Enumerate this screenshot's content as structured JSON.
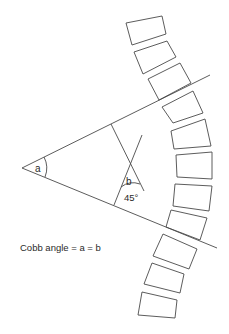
{
  "figure": {
    "colors": {
      "stroke": "#4a4a4a",
      "text": "#2a2a2a",
      "background": "#ffffff"
    },
    "labels": {
      "angle_a": "a",
      "angle_b": "b",
      "angle_b_value": "45°",
      "caption": "Cobb angle = a = b"
    },
    "vertebrae": [
      "126,23 162,16 166,34 132,45",
      "134,52 167,41 176,57 143,74",
      "148,79 180,63 191,83 159,100",
      "162,107 193,91 203,113 173,123",
      "171,131 205,119 211,146 174,149",
      "176,155 212,152 212,179 177,177",
      "175,184 212,186 209,211 173,206",
      "171,210 207,218 200,240 166,227",
      "163,234 197,249 189,269 153,256",
      "152,263 184,274 180,293 144,284",
      "142,292 177,300 175,318 138,315"
    ]
  }
}
